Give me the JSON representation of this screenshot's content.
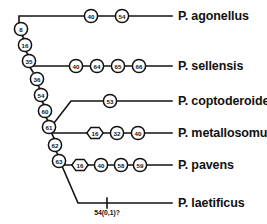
{
  "figure": {
    "type": "cladogram",
    "background_color": "#ffffff",
    "line_color": "#121212"
  },
  "taxa": [
    {
      "id": "agonellus",
      "label": "P. agonellus",
      "x": 178,
      "y": 16
    },
    {
      "id": "sellensis",
      "label": "P. sellensis",
      "x": 178,
      "y": 66
    },
    {
      "id": "coptoderoides",
      "label": "P. coptoderoides",
      "x": 178,
      "y": 101
    },
    {
      "id": "metallosomus",
      "label": "P. metallosomus",
      "x": 178,
      "y": 133
    },
    {
      "id": "pavens",
      "label": "P. pavens",
      "x": 178,
      "y": 165
    },
    {
      "id": "laetificus",
      "label": "P. laetificus",
      "x": 178,
      "y": 203
    }
  ],
  "spine_nodes": [
    {
      "label": "8",
      "shape": "circle",
      "x": 21,
      "y": 29
    },
    {
      "label": "16",
      "shape": "circle",
      "x": 25,
      "y": 45
    },
    {
      "label": "35",
      "shape": "circle",
      "x": 29,
      "y": 61
    },
    {
      "label": "36",
      "shape": "circle",
      "x": 37,
      "y": 79
    },
    {
      "label": "54",
      "shape": "circle",
      "x": 41,
      "y": 95
    },
    {
      "label": "60",
      "shape": "circle",
      "x": 45,
      "y": 111
    },
    {
      "label": "61",
      "shape": "circle",
      "x": 49,
      "y": 127
    },
    {
      "label": "62",
      "shape": "circle",
      "x": 55,
      "y": 145
    },
    {
      "label": "63",
      "shape": "circle",
      "x": 59,
      "y": 161
    }
  ],
  "branch_nodes": {
    "agonellus": [
      {
        "label": "40",
        "shape": "circle",
        "x": 91,
        "y": 16
      },
      {
        "label": "54",
        "shape": "circle",
        "x": 122,
        "y": 16
      }
    ],
    "sellensis": [
      {
        "label": "40",
        "shape": "circle",
        "x": 76,
        "y": 66
      },
      {
        "label": "64",
        "shape": "circle",
        "x": 97,
        "y": 66
      },
      {
        "label": "65",
        "shape": "circle",
        "x": 118,
        "y": 66
      },
      {
        "label": "66",
        "shape": "circle",
        "x": 139,
        "y": 66
      }
    ],
    "coptoderoides": [
      {
        "label": "53",
        "shape": "circle",
        "x": 110,
        "y": 101
      }
    ],
    "metallosomus": [
      {
        "label": "16",
        "shape": "hexagon",
        "x": 95,
        "y": 133
      },
      {
        "label": "32",
        "shape": "circle",
        "x": 117,
        "y": 133
      },
      {
        "label": "40",
        "shape": "circle",
        "x": 138,
        "y": 133
      }
    ],
    "pavens": [
      {
        "label": "16",
        "shape": "hexagon",
        "x": 80,
        "y": 165
      },
      {
        "label": "40",
        "shape": "circle",
        "x": 101,
        "y": 165
      },
      {
        "label": "58",
        "shape": "circle",
        "x": 121,
        "y": 165
      },
      {
        "label": "59",
        "shape": "circle",
        "x": 140,
        "y": 165
      }
    ]
  },
  "annotations": [
    {
      "id": "laetificus-tick",
      "label": "54(0,1)?",
      "tick_x": 107,
      "tick_y": 203,
      "label_x": 107,
      "label_y": 209
    }
  ]
}
